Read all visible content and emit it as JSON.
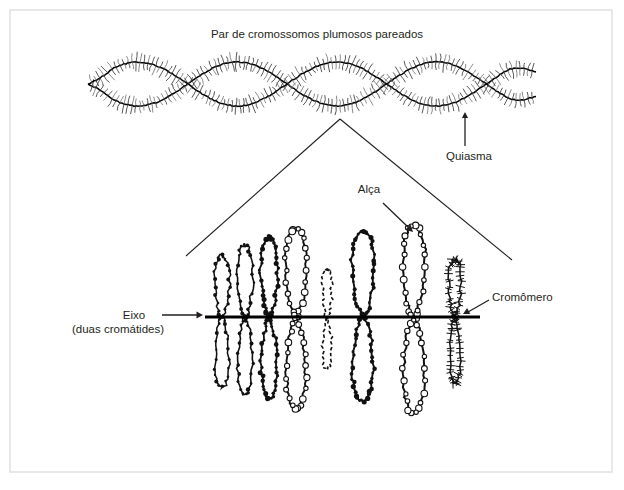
{
  "figure": {
    "title": "Par de cromossomos plumosos pareados",
    "background_color": "#ffffff",
    "border_color": "#e3e3e3",
    "ink_color": "#231f20"
  },
  "labels": {
    "chiasma": "Quiasma",
    "loop": "Alça",
    "axis_line1": "Eixo",
    "axis_line2": "(duas cromátides)",
    "chromomere": "Cromômero"
  },
  "top_panel": {
    "description": "paired lampbrush chromosomes with four chiasmata",
    "x_start": 88,
    "x_end": 536,
    "center_y": 84,
    "lens_count": 4,
    "lens_half_height": 22,
    "crossings_x": [
      148,
      243,
      340,
      437
    ],
    "bristle_spacing": 4.2,
    "bristle_length": 7.5
  },
  "magnified_panel": {
    "axis_y": 317,
    "axis_x_start": 205,
    "axis_x_end": 480,
    "loops": [
      {
        "x": 222,
        "w": 17,
        "up": 62,
        "down": 70,
        "style": "light-bead",
        "stroke": 1.5
      },
      {
        "x": 245,
        "w": 18,
        "up": 72,
        "down": 78,
        "style": "light-bead",
        "stroke": 1.6
      },
      {
        "x": 269,
        "w": 19,
        "up": 80,
        "down": 82,
        "style": "dark-bead",
        "stroke": 1.8
      },
      {
        "x": 296,
        "w": 24,
        "up": 88,
        "down": 92,
        "style": "open-bead",
        "stroke": 1.9
      },
      {
        "x": 327,
        "w": 11,
        "up": 48,
        "down": 52,
        "style": "dashed",
        "stroke": 1.6
      },
      {
        "x": 363,
        "w": 26,
        "up": 86,
        "down": 84,
        "style": "dark-bead",
        "stroke": 1.9
      },
      {
        "x": 414,
        "w": 26,
        "up": 92,
        "down": 96,
        "style": "open-bead",
        "stroke": 2.0
      },
      {
        "x": 455,
        "w": 14,
        "up": 58,
        "down": 66,
        "style": "bristle",
        "stroke": 1.5
      }
    ]
  },
  "connectors": {
    "apex_x": 340,
    "apex_y": 119,
    "left_x": 186,
    "left_y": 256,
    "right_x": 512,
    "right_y": 260
  },
  "annotations": {
    "chiasma_arrow": {
      "x": 465,
      "y_from": 146,
      "y_to": 112,
      "text_x": 441,
      "text_y": 160
    },
    "loop_arrow": {
      "x1": 383,
      "y1": 203,
      "x2": 413,
      "y2": 232,
      "text_x": 369,
      "text_y": 193
    },
    "axis_arrow": {
      "x1": 162,
      "y1": 315,
      "x2": 203,
      "y2": 315,
      "text_x": 118,
      "text_y": 319,
      "text2_y": 333
    },
    "chromomere_arrow": {
      "x1": 489,
      "y1": 300,
      "x2": 463,
      "y2": 314,
      "text_x": 492,
      "text_y": 301
    }
  }
}
